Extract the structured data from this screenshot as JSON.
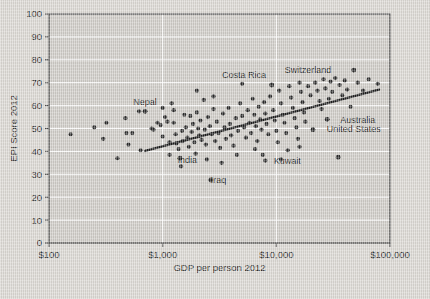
{
  "chart_data": {
    "type": "scatter",
    "title": "",
    "xlabel": "GDP per person 2012",
    "ylabel": "EPI Score 2012",
    "xscale": "log",
    "xlim": [
      100,
      100000
    ],
    "ylim": [
      0,
      100
    ],
    "xticks": [
      100,
      1000,
      10000,
      100000
    ],
    "xtick_labels": [
      "$100",
      "$1,000",
      "$10,000",
      "$100,000"
    ],
    "yticks": [
      0,
      10,
      20,
      30,
      40,
      50,
      60,
      70,
      80,
      90,
      100
    ],
    "ytick_labels": [
      "0",
      "10",
      "20",
      "30",
      "40",
      "50",
      "60",
      "70",
      "80",
      "90",
      "100"
    ],
    "grid": true,
    "legend": "none",
    "marker_color": "#2b2b2b",
    "plot_bg": "#cdcac5",
    "figure_bg": "#d9d6d1",
    "grid_color": "#ffffff",
    "trendline": {
      "color": "#1c1c1c",
      "x": [
        700,
        80000
      ],
      "y": [
        40.2,
        67.0
      ]
    },
    "annotations": [
      {
        "text": "Nepal",
        "label_x": 700,
        "label_y": 61.5,
        "dot_x": 700,
        "dot_y": 57.5
      },
      {
        "text": "Costa Rica",
        "label_x": 5200,
        "label_y": 73.5,
        "dot_x": 9100,
        "dot_y": 69.0
      },
      {
        "text": "Switzerland",
        "label_x": 19000,
        "label_y": 75.5,
        "dot_x": 48000,
        "dot_y": 75.5
      },
      {
        "text": "Australia",
        "label_x": 52000,
        "label_y": 54.0,
        "dot_x": 28000,
        "dot_y": 54.0
      },
      {
        "text": "United States",
        "label_x": 48000,
        "label_y": 50.0,
        "dot_x": 21000,
        "dot_y": 49.5
      },
      {
        "text": "India",
        "label_x": 1650,
        "label_y": 36.5,
        "dot_x": 1420,
        "dot_y": 37.0
      },
      {
        "text": "Iraq",
        "label_x": 3100,
        "label_y": 27.5,
        "dot_x": 2650,
        "dot_y": 27.5
      },
      {
        "text": "Kuwait",
        "label_x": 12500,
        "label_y": 36.0,
        "dot_x": 35000,
        "dot_y": 37.5
      }
    ],
    "points": [
      {
        "x": 155,
        "y": 47.5
      },
      {
        "x": 320,
        "y": 52.5
      },
      {
        "x": 300,
        "y": 45.5
      },
      {
        "x": 470,
        "y": 54.5
      },
      {
        "x": 480,
        "y": 48.0
      },
      {
        "x": 540,
        "y": 48.0
      },
      {
        "x": 620,
        "y": 57.5
      },
      {
        "x": 700,
        "y": 57.5
      },
      {
        "x": 640,
        "y": 40.5
      },
      {
        "x": 800,
        "y": 50.0
      },
      {
        "x": 830,
        "y": 49.5
      },
      {
        "x": 900,
        "y": 52.5
      },
      {
        "x": 960,
        "y": 51.5
      },
      {
        "x": 1000,
        "y": 46.5
      },
      {
        "x": 1050,
        "y": 55.0
      },
      {
        "x": 1100,
        "y": 53.0
      },
      {
        "x": 1150,
        "y": 44.0
      },
      {
        "x": 1150,
        "y": 38.5
      },
      {
        "x": 1250,
        "y": 58.0
      },
      {
        "x": 1250,
        "y": 52.5
      },
      {
        "x": 1300,
        "y": 47.5
      },
      {
        "x": 1320,
        "y": 43.5
      },
      {
        "x": 1380,
        "y": 41.0
      },
      {
        "x": 1420,
        "y": 37.0
      },
      {
        "x": 1450,
        "y": 33.5
      },
      {
        "x": 1480,
        "y": 49.0
      },
      {
        "x": 1500,
        "y": 44.5
      },
      {
        "x": 1550,
        "y": 56.0
      },
      {
        "x": 1600,
        "y": 50.5
      },
      {
        "x": 1650,
        "y": 46.0
      },
      {
        "x": 1700,
        "y": 42.0
      },
      {
        "x": 1750,
        "y": 55.5
      },
      {
        "x": 1800,
        "y": 48.5
      },
      {
        "x": 1850,
        "y": 52.0
      },
      {
        "x": 1900,
        "y": 44.0
      },
      {
        "x": 1950,
        "y": 39.0
      },
      {
        "x": 2000,
        "y": 57.0
      },
      {
        "x": 2050,
        "y": 50.0
      },
      {
        "x": 2100,
        "y": 47.0
      },
      {
        "x": 2150,
        "y": 53.5
      },
      {
        "x": 2200,
        "y": 45.0
      },
      {
        "x": 2300,
        "y": 62.5
      },
      {
        "x": 2350,
        "y": 49.5
      },
      {
        "x": 2400,
        "y": 43.0
      },
      {
        "x": 2500,
        "y": 55.0
      },
      {
        "x": 2600,
        "y": 51.0
      },
      {
        "x": 2650,
        "y": 27.5
      },
      {
        "x": 2700,
        "y": 47.5
      },
      {
        "x": 2800,
        "y": 58.5
      },
      {
        "x": 2900,
        "y": 44.5
      },
      {
        "x": 3000,
        "y": 53.0
      },
      {
        "x": 3100,
        "y": 48.0
      },
      {
        "x": 3200,
        "y": 41.5
      },
      {
        "x": 3400,
        "y": 56.5
      },
      {
        "x": 3500,
        "y": 50.5
      },
      {
        "x": 3600,
        "y": 45.5
      },
      {
        "x": 3800,
        "y": 59.0
      },
      {
        "x": 3900,
        "y": 52.0
      },
      {
        "x": 4000,
        "y": 47.0
      },
      {
        "x": 4200,
        "y": 42.5
      },
      {
        "x": 4400,
        "y": 54.5
      },
      {
        "x": 4600,
        "y": 49.0
      },
      {
        "x": 4800,
        "y": 61.0
      },
      {
        "x": 5000,
        "y": 55.5
      },
      {
        "x": 5200,
        "y": 50.5
      },
      {
        "x": 5400,
        "y": 46.0
      },
      {
        "x": 5600,
        "y": 58.0
      },
      {
        "x": 5800,
        "y": 52.5
      },
      {
        "x": 6000,
        "y": 48.0
      },
      {
        "x": 6200,
        "y": 63.0
      },
      {
        "x": 6400,
        "y": 56.0
      },
      {
        "x": 6600,
        "y": 51.0
      },
      {
        "x": 6800,
        "y": 44.5
      },
      {
        "x": 7000,
        "y": 59.5
      },
      {
        "x": 7200,
        "y": 54.0
      },
      {
        "x": 7400,
        "y": 49.5
      },
      {
        "x": 7600,
        "y": 38.5
      },
      {
        "x": 7800,
        "y": 61.5
      },
      {
        "x": 8000,
        "y": 56.5
      },
      {
        "x": 8200,
        "y": 52.0
      },
      {
        "x": 8500,
        "y": 47.5
      },
      {
        "x": 8800,
        "y": 64.0
      },
      {
        "x": 9100,
        "y": 69.0
      },
      {
        "x": 9400,
        "y": 58.0
      },
      {
        "x": 9700,
        "y": 53.5
      },
      {
        "x": 10000,
        "y": 49.0
      },
      {
        "x": 10300,
        "y": 44.0
      },
      {
        "x": 10600,
        "y": 66.5
      },
      {
        "x": 11000,
        "y": 61.0
      },
      {
        "x": 11400,
        "y": 56.0
      },
      {
        "x": 11800,
        "y": 52.5
      },
      {
        "x": 12200,
        "y": 48.0
      },
      {
        "x": 12600,
        "y": 40.5
      },
      {
        "x": 13000,
        "y": 68.5
      },
      {
        "x": 13500,
        "y": 63.5
      },
      {
        "x": 14000,
        "y": 59.0
      },
      {
        "x": 14500,
        "y": 54.5
      },
      {
        "x": 15000,
        "y": 50.5
      },
      {
        "x": 15500,
        "y": 45.5
      },
      {
        "x": 16000,
        "y": 70.0
      },
      {
        "x": 16500,
        "y": 66.0
      },
      {
        "x": 17000,
        "y": 61.5
      },
      {
        "x": 17500,
        "y": 57.0
      },
      {
        "x": 18000,
        "y": 53.0
      },
      {
        "x": 19000,
        "y": 68.5
      },
      {
        "x": 20000,
        "y": 64.5
      },
      {
        "x": 21000,
        "y": 49.5
      },
      {
        "x": 22000,
        "y": 70.0
      },
      {
        "x": 23000,
        "y": 66.5
      },
      {
        "x": 24000,
        "y": 62.0
      },
      {
        "x": 25000,
        "y": 58.5
      },
      {
        "x": 26000,
        "y": 71.5
      },
      {
        "x": 27000,
        "y": 67.5
      },
      {
        "x": 28000,
        "y": 54.0
      },
      {
        "x": 29000,
        "y": 63.0
      },
      {
        "x": 30000,
        "y": 70.5
      },
      {
        "x": 31000,
        "y": 66.0
      },
      {
        "x": 33000,
        "y": 72.0
      },
      {
        "x": 35000,
        "y": 37.5
      },
      {
        "x": 36000,
        "y": 69.0
      },
      {
        "x": 38000,
        "y": 64.5
      },
      {
        "x": 40000,
        "y": 71.0
      },
      {
        "x": 42000,
        "y": 67.0
      },
      {
        "x": 45000,
        "y": 59.5
      },
      {
        "x": 48000,
        "y": 75.5
      },
      {
        "x": 52000,
        "y": 70.0
      },
      {
        "x": 58000,
        "y": 66.5
      },
      {
        "x": 65000,
        "y": 71.5
      },
      {
        "x": 78000,
        "y": 69.5
      },
      {
        "x": 500,
        "y": 43.0
      },
      {
        "x": 1000,
        "y": 59.0
      },
      {
        "x": 2450,
        "y": 36.5
      },
      {
        "x": 3300,
        "y": 35.0
      },
      {
        "x": 4500,
        "y": 38.5
      },
      {
        "x": 6500,
        "y": 41.0
      },
      {
        "x": 8000,
        "y": 36.0
      },
      {
        "x": 11000,
        "y": 36.5
      },
      {
        "x": 16000,
        "y": 42.0
      },
      {
        "x": 2000,
        "y": 66.5
      },
      {
        "x": 5000,
        "y": 69.5
      },
      {
        "x": 1200,
        "y": 61.0
      },
      {
        "x": 2800,
        "y": 64.0
      },
      {
        "x": 400,
        "y": 37.0
      },
      {
        "x": 250,
        "y": 50.5
      }
    ]
  }
}
